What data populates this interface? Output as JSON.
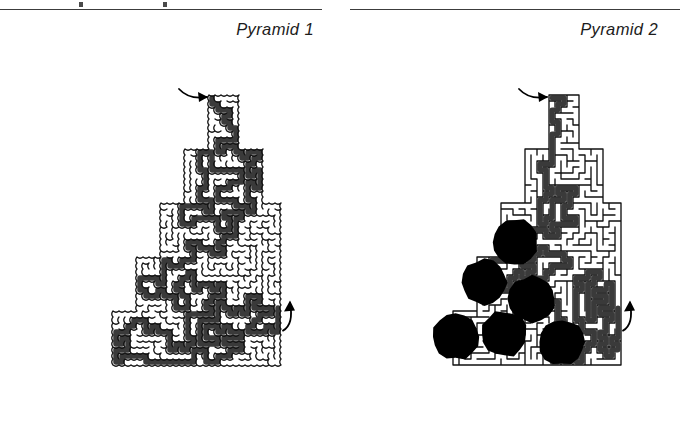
{
  "page": {
    "background": "#ffffff",
    "ink": "#1c1c1c",
    "rule_color": "#3c3c3c"
  },
  "columns": [
    {
      "id": "left",
      "caption": "Pyramid 1",
      "maze": {
        "name": "pyramid-1-maze",
        "wall_style": "rounded",
        "wall_color": "#111111",
        "solution_color": "#3a3a3a",
        "cell": 6,
        "has_holes": false,
        "holes": [],
        "tiers": [
          {
            "cols": 5,
            "rows": 9,
            "center": 27
          },
          {
            "cols": 13,
            "rows": 9,
            "center": 27
          },
          {
            "cols": 21,
            "rows": 9,
            "center": 27
          },
          {
            "cols": 29,
            "rows": 9,
            "center": 27
          },
          {
            "cols": 37,
            "rows": 9,
            "center": 27
          }
        ],
        "entrance": {
          "label": "entrance-arrow",
          "side": "top-left"
        },
        "exit": {
          "label": "exit-arrow",
          "side": "right-lower"
        }
      }
    },
    {
      "id": "right",
      "caption": "Pyramid 2",
      "maze": {
        "name": "pyramid-2-maze",
        "wall_style": "orthogonal",
        "wall_color": "#111111",
        "solution_color": "#3a3a3a",
        "cell": 6,
        "has_holes": true,
        "holes": [
          {
            "cx": 0.52,
            "cy": 0.545,
            "r": 0.105
          },
          {
            "cx": 0.385,
            "cy": 0.695,
            "r": 0.105
          },
          {
            "cx": 0.6,
            "cy": 0.755,
            "r": 0.105
          },
          {
            "cx": 0.255,
            "cy": 0.895,
            "r": 0.105
          },
          {
            "cx": 0.475,
            "cy": 0.885,
            "r": 0.105
          },
          {
            "cx": 0.735,
            "cy": 0.915,
            "r": 0.105
          }
        ],
        "tiers": [
          {
            "cols": 5,
            "rows": 9,
            "center": 27
          },
          {
            "cols": 13,
            "rows": 9,
            "center": 27
          },
          {
            "cols": 21,
            "rows": 9,
            "center": 27
          },
          {
            "cols": 29,
            "rows": 9,
            "center": 27
          },
          {
            "cols": 37,
            "rows": 9,
            "center": 27
          }
        ],
        "entrance": {
          "label": "entrance-arrow",
          "side": "top-left"
        },
        "exit": {
          "label": "exit-arrow",
          "side": "right-lower"
        }
      }
    }
  ]
}
